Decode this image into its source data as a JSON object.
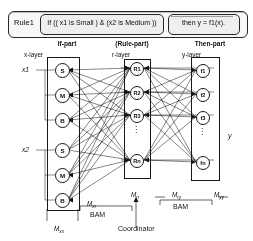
{
  "diagram": {
    "title_rule": {
      "rule_label": "Rule1",
      "if_part": "If (( x1 is Small ) & (x2 is Medium ))",
      "then_part": "then y = f1(x)."
    },
    "captions": {
      "if_part": "If-part",
      "rule_part": "(Rule-part)",
      "then_part": "Then-part",
      "x_layer": "x-layer",
      "r_layer": "r-layer",
      "y_layer": "y-layer"
    },
    "inputs": {
      "x1": "x1",
      "x2": "x2"
    },
    "output": {
      "y": "y"
    },
    "x_layer_nodes": [
      {
        "label": "S",
        "group": "x1"
      },
      {
        "label": "M",
        "group": "x1"
      },
      {
        "label": "B",
        "group": "x1"
      },
      {
        "label": "S",
        "group": "x2"
      },
      {
        "label": "M",
        "group": "x2"
      },
      {
        "label": "B",
        "group": "x2"
      }
    ],
    "r_layer_nodes": [
      {
        "label": "R1"
      },
      {
        "label": "R2"
      },
      {
        "label": "R3"
      },
      {
        "label": "⋮"
      },
      {
        "label": "Rn"
      }
    ],
    "y_layer_nodes": [
      {
        "label": "f1"
      },
      {
        "label": "f2"
      },
      {
        "label": "f3"
      },
      {
        "label": "⋮"
      },
      {
        "label": "fn"
      }
    ],
    "matrices": {
      "m_xx": "Mxx",
      "m_xr": "Mxr",
      "m_rr": "Mrr",
      "m_ry": "Mry",
      "m_yy": "Myy"
    },
    "bam_left": "BAM",
    "bam_right": "BAM",
    "coordinator": "Coordinator"
  }
}
